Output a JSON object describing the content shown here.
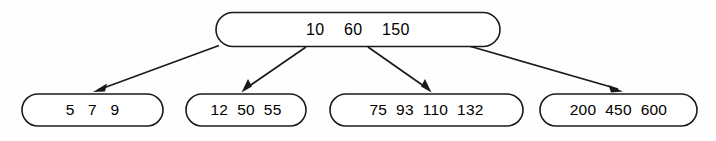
{
  "diagram": {
    "type": "b-tree",
    "title": "",
    "colors": {
      "background": "#fefefe",
      "stroke": "#1a1a1a",
      "node_fill": "#ffffff",
      "text": "#000000"
    },
    "root": {
      "id": "root-node",
      "keys": [
        "10",
        "60",
        "150"
      ],
      "keys_text": "10    60    150"
    },
    "children": [
      {
        "id": "leaf-node-1",
        "keys": [
          "5",
          "7",
          "9"
        ],
        "keys_text": "5   7   9"
      },
      {
        "id": "leaf-node-2",
        "keys": [
          "12",
          "50",
          "55"
        ],
        "keys_text": "12  50  55"
      },
      {
        "id": "leaf-node-3",
        "keys": [
          "75",
          "93",
          "110",
          "132"
        ],
        "keys_text": "75  93  110  132"
      },
      {
        "id": "leaf-node-4",
        "keys": [
          "200",
          "450",
          "600"
        ],
        "keys_text": "200  450  600"
      }
    ],
    "edges": [
      {
        "id": "edge-root-to-leaf-1",
        "from": "root-node",
        "to": "leaf-node-1"
      },
      {
        "id": "edge-root-to-leaf-2",
        "from": "root-node",
        "to": "leaf-node-2"
      },
      {
        "id": "edge-root-to-leaf-3",
        "from": "root-node",
        "to": "leaf-node-3"
      },
      {
        "id": "edge-root-to-leaf-4",
        "from": "root-node",
        "to": "leaf-node-4"
      }
    ]
  }
}
